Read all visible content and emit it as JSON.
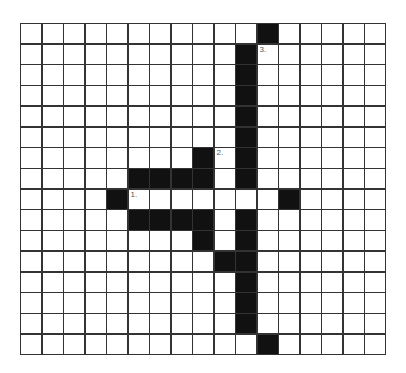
{
  "puzzle": {
    "cols": 17,
    "rows": 16,
    "colors": {
      "filled": "#111111",
      "empty": "#ffffff",
      "grid_line": "#333333"
    },
    "black_cells": [
      [
        0,
        11
      ],
      [
        1,
        10
      ],
      [
        2,
        10
      ],
      [
        3,
        10
      ],
      [
        4,
        10
      ],
      [
        5,
        10
      ],
      [
        6,
        8
      ],
      [
        6,
        10
      ],
      [
        7,
        5
      ],
      [
        7,
        6
      ],
      [
        7,
        7
      ],
      [
        7,
        8
      ],
      [
        7,
        10
      ],
      [
        8,
        4
      ],
      [
        8,
        12
      ],
      [
        9,
        5
      ],
      [
        9,
        6
      ],
      [
        9,
        7
      ],
      [
        9,
        8
      ],
      [
        9,
        10
      ],
      [
        10,
        8
      ],
      [
        10,
        10
      ],
      [
        11,
        9
      ],
      [
        11,
        10
      ],
      [
        12,
        10
      ],
      [
        13,
        10
      ],
      [
        14,
        10
      ],
      [
        15,
        11
      ]
    ],
    "numbers": [
      {
        "row": 8,
        "col": 5,
        "label": "1."
      },
      {
        "row": 6,
        "col": 9,
        "label": "2."
      },
      {
        "row": 1,
        "col": 11,
        "label": "3."
      }
    ]
  }
}
